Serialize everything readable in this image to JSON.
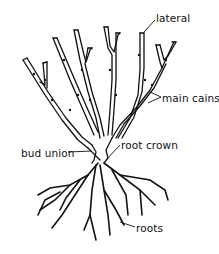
{
  "diagram": {
    "labels": {
      "lateral": "lateral",
      "main_cains": "main cains",
      "bud_union": "bud union",
      "root_crown": "root crown",
      "roots": "roots"
    },
    "colors": {
      "stroke": "#111111",
      "background": "#ffffff"
    }
  }
}
